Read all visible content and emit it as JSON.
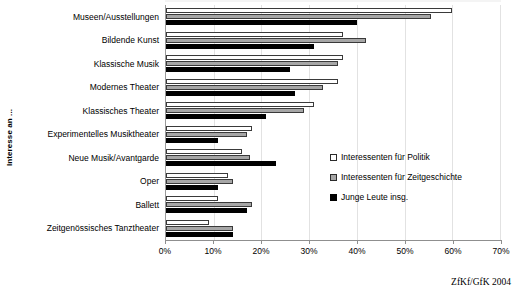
{
  "chart_data": {
    "type": "bar",
    "orientation": "horizontal",
    "title": "",
    "xlabel": "",
    "ylabel": "Interesse an ...",
    "xlim": [
      0,
      70
    ],
    "xtick_labels": [
      "0%",
      "10%",
      "20%",
      "30%",
      "40%",
      "50%",
      "60%",
      "70%"
    ],
    "xticks": [
      0,
      10,
      20,
      30,
      40,
      50,
      60,
      70
    ],
    "grid": true,
    "grid_axis": "x",
    "legend_position": "right-inside",
    "categories": [
      "Museen/Ausstellungen",
      "Bildende Kunst",
      "Klassische Musik",
      "Modernes Theater",
      "Klassisches Theater",
      "Experimentelles Musiktheater",
      "Neue Musik/Avantgarde",
      "Oper",
      "Ballett",
      "Zeitgenössisches Tanztheater"
    ],
    "series": [
      {
        "name": "Interessenten für Politik",
        "color": "#ffffff",
        "values": [
          60,
          37,
          37,
          36,
          31,
          18,
          16,
          13,
          11,
          9
        ]
      },
      {
        "name": "Interessenten für Zeitgeschichte",
        "color": "#a6a6a6",
        "values": [
          55.5,
          42,
          36,
          33,
          29,
          17,
          17.5,
          14,
          18,
          14
        ]
      },
      {
        "name": "Junge Leute insg.",
        "color": "#000000",
        "values": [
          40,
          31,
          26,
          27,
          21,
          11,
          23,
          11,
          17,
          14
        ]
      }
    ],
    "source_credit": "ZfKf/GfK 2004"
  }
}
